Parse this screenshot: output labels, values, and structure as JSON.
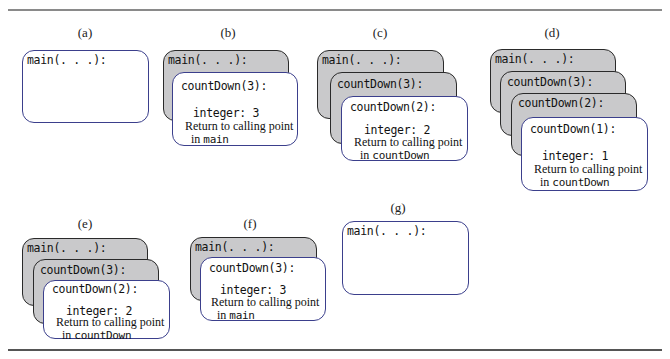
{
  "figure": {
    "panels": [
      {
        "label": "(a)",
        "frames": [
          {
            "title": "main(. . .):"
          }
        ]
      },
      {
        "label": "(b)",
        "frames": [
          {
            "title": "main(. . .):"
          },
          {
            "title": "countDown(3):",
            "variable": "integer: 3",
            "return_text": "Return to calling point",
            "return_in": "in",
            "return_target": "main"
          }
        ]
      },
      {
        "label": "(c)",
        "frames": [
          {
            "title": "main(. . .):"
          },
          {
            "title": "countDown(3):"
          },
          {
            "title": "countDown(2):",
            "variable": "integer: 2",
            "return_text": "Return to calling point",
            "return_in": "in",
            "return_target": "countDown"
          }
        ]
      },
      {
        "label": "(d)",
        "frames": [
          {
            "title": "main(. . .):"
          },
          {
            "title": "countDown(3):"
          },
          {
            "title": "countDown(2):"
          },
          {
            "title": "countDown(1):",
            "variable": "integer: 1",
            "return_text": "Return to calling point",
            "return_in": "in",
            "return_target": "countDown"
          }
        ]
      },
      {
        "label": "(e)",
        "frames": [
          {
            "title": "main(. . .):"
          },
          {
            "title": "countDown(3):"
          },
          {
            "title": "countDown(2):",
            "variable": "integer: 2",
            "return_text": "Return to calling point",
            "return_in": "in",
            "return_target": "countDown"
          }
        ]
      },
      {
        "label": "(f)",
        "frames": [
          {
            "title": "main(. . .):"
          },
          {
            "title": "countDown(3):",
            "variable": "integer: 3",
            "return_text": "Return to calling point",
            "return_in": "in",
            "return_target": "main"
          }
        ]
      },
      {
        "label": "(g)",
        "frames": [
          {
            "title": "main(. . .):"
          }
        ]
      }
    ],
    "colors": {
      "active_border": "#3b3f8c",
      "stacked_fill": "#c9c9cb",
      "stacked_border": "#2a2a2a"
    }
  }
}
